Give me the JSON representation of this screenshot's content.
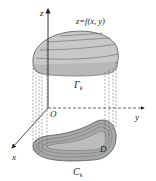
{
  "diagram": {
    "type": "3d-surface-projection",
    "labels": {
      "z_axis": "z",
      "y_axis": "y",
      "x_axis": "x",
      "origin": "O",
      "surface": "z=f(x, y)",
      "upper_curve": "Γ",
      "upper_curve_sub": "k",
      "lower_curve": "C",
      "lower_curve_sub": "k",
      "region": "D"
    },
    "colors": {
      "surface_fill": "#c8c8c8",
      "region_fill": "#a8a8a8",
      "lines": "#444444",
      "contour": "#6a6a6a",
      "background": "#ffffff"
    }
  }
}
